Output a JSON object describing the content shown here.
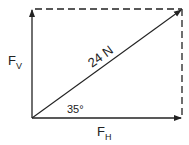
{
  "diagram": {
    "resultant": {
      "label": "24 N",
      "magnitude": 24,
      "unit": "N"
    },
    "angle": {
      "label": "35°",
      "degrees": 35
    },
    "components": {
      "vertical": {
        "symbol": "F",
        "subscript": "V"
      },
      "horizontal": {
        "symbol": "F",
        "subscript": "H"
      }
    },
    "colors": {
      "stroke": "#222222",
      "background": "#ffffff"
    }
  }
}
